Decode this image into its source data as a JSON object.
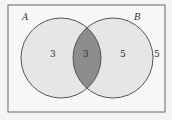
{
  "diagram": {
    "type": "venn",
    "universe": {
      "label": "",
      "outside_count": "5"
    },
    "sets": [
      {
        "name": "A",
        "only_count": "3"
      },
      {
        "name": "B",
        "only_count": "5"
      }
    ],
    "intersection": {
      "sets": [
        "A",
        "B"
      ],
      "count": "3",
      "shaded": true
    },
    "colors": {
      "background": "#f4f4f4",
      "circle_fill": "#e6e6e6",
      "intersection_fill": "#8c8c8c",
      "stroke": "#555555"
    }
  }
}
